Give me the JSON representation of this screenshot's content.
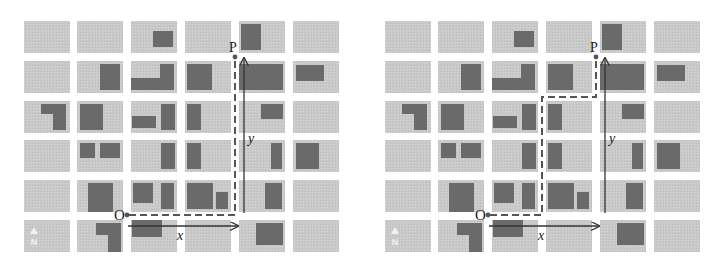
{
  "figure": {
    "colors": {
      "background": "#ffffff",
      "block": "#c9c9c9",
      "building": "#6a6a6a",
      "path": "#555555",
      "axis": "#333333",
      "compass": "#f2f2f2"
    },
    "grid": {
      "col_x": [
        24,
        77,
        131,
        185,
        239,
        293
      ],
      "col_w": 46,
      "row_y": [
        21,
        61,
        101,
        140,
        180,
        220
      ],
      "row_h": 32
    },
    "buildings": [
      {
        "c": 2,
        "r": 0,
        "x": 22,
        "y": 10,
        "w": 20,
        "h": 16
      },
      {
        "c": 4,
        "r": 0,
        "x": 2,
        "y": 3,
        "w": 20,
        "h": 26
      },
      {
        "c": 1,
        "r": 1,
        "x": 23,
        "y": 3,
        "w": 20,
        "h": 26
      },
      {
        "c": 2,
        "r": 1,
        "x": 0,
        "y": 17,
        "w": 43,
        "h": 12
      },
      {
        "c": 2,
        "r": 1,
        "x": 29,
        "y": 3,
        "w": 14,
        "h": 26
      },
      {
        "c": 3,
        "r": 1,
        "x": 2,
        "y": 3,
        "w": 25,
        "h": 26
      },
      {
        "c": 4,
        "r": 1,
        "x": 0,
        "y": 3,
        "w": 44,
        "h": 26
      },
      {
        "c": 5,
        "r": 1,
        "x": 3,
        "y": 4,
        "w": 28,
        "h": 16
      },
      {
        "c": 0,
        "r": 2,
        "x": 17,
        "y": 3,
        "w": 25,
        "h": 10
      },
      {
        "c": 0,
        "r": 2,
        "x": 29,
        "y": 3,
        "w": 13,
        "h": 26
      },
      {
        "c": 1,
        "r": 2,
        "x": 3,
        "y": 3,
        "w": 23,
        "h": 26
      },
      {
        "c": 2,
        "r": 2,
        "x": 1,
        "y": 15,
        "w": 24,
        "h": 12
      },
      {
        "c": 2,
        "r": 2,
        "x": 30,
        "y": 3,
        "w": 14,
        "h": 26
      },
      {
        "c": 3,
        "r": 2,
        "x": 2,
        "y": 3,
        "w": 14,
        "h": 26
      },
      {
        "c": 4,
        "r": 2,
        "x": 22,
        "y": 3,
        "w": 22,
        "h": 15
      },
      {
        "c": 1,
        "r": 3,
        "x": 3,
        "y": 3,
        "w": 15,
        "h": 15
      },
      {
        "c": 1,
        "r": 3,
        "x": 23,
        "y": 3,
        "w": 20,
        "h": 15
      },
      {
        "c": 2,
        "r": 3,
        "x": 30,
        "y": 3,
        "w": 14,
        "h": 26
      },
      {
        "c": 3,
        "r": 3,
        "x": 2,
        "y": 3,
        "w": 14,
        "h": 26
      },
      {
        "c": 4,
        "r": 3,
        "x": 32,
        "y": 3,
        "w": 11,
        "h": 26
      },
      {
        "c": 5,
        "r": 3,
        "x": 3,
        "y": 3,
        "w": 23,
        "h": 26
      },
      {
        "c": 1,
        "r": 4,
        "x": 11,
        "y": 3,
        "w": 25,
        "h": 29
      },
      {
        "c": 2,
        "r": 4,
        "x": 2,
        "y": 3,
        "w": 20,
        "h": 20
      },
      {
        "c": 2,
        "r": 4,
        "x": 30,
        "y": 3,
        "w": 13,
        "h": 26
      },
      {
        "c": 3,
        "r": 4,
        "x": 2,
        "y": 3,
        "w": 26,
        "h": 26
      },
      {
        "c": 3,
        "r": 4,
        "x": 31,
        "y": 12,
        "w": 12,
        "h": 17
      },
      {
        "c": 4,
        "r": 4,
        "x": 26,
        "y": 3,
        "w": 17,
        "h": 26
      },
      {
        "c": 1,
        "r": 5,
        "x": 19,
        "y": 3,
        "w": 25,
        "h": 12
      },
      {
        "c": 1,
        "r": 5,
        "x": 31,
        "y": 3,
        "w": 13,
        "h": 29
      },
      {
        "c": 2,
        "r": 5,
        "x": 1,
        "y": 0,
        "w": 30,
        "h": 17
      },
      {
        "c": 4,
        "r": 5,
        "x": 17,
        "y": 3,
        "w": 27,
        "h": 22
      }
    ],
    "labels": {
      "origin": "O",
      "target": "P",
      "x_axis": "x",
      "y_axis": "y",
      "compass": "N"
    },
    "points": {
      "origin": {
        "x": 127,
        "y": 215
      },
      "target": {
        "x": 235,
        "y": 57
      }
    },
    "axes": {
      "x_arrow": {
        "x1": 128,
        "y1": 226,
        "x2": 238,
        "y2": 226
      },
      "y_arrow": {
        "x1": 244,
        "y1": 213,
        "x2": 244,
        "y2": 58
      }
    },
    "panels": [
      {
        "id": "left",
        "offset_x": 0,
        "caption": "Direct route: east along x then north along y",
        "path": [
          [
            129,
            215
          ],
          [
            235,
            215
          ],
          [
            235,
            58
          ]
        ]
      },
      {
        "id": "right",
        "offset_x": 361,
        "caption": "Alternate route with intermediate turns",
        "path": [
          [
            129,
            215
          ],
          [
            181,
            215
          ],
          [
            181,
            97
          ],
          [
            235,
            97
          ],
          [
            235,
            58
          ]
        ]
      }
    ]
  }
}
